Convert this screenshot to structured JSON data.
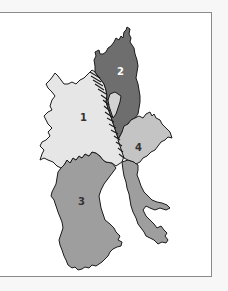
{
  "map": {
    "type": "regional division map",
    "colors": {
      "background": "#f7f7f7",
      "frame_fill": "#ffffff",
      "frame_border": "#8a8a8a",
      "outline": "#1a1a1a",
      "region_1": "#e6e6e6",
      "region_2": "#6e6e6e",
      "region_3": "#9e9e9e",
      "region_4": "#c4c4c4",
      "inset_light": "#d2d2d2"
    },
    "regions": [
      {
        "id": "1",
        "label": "1",
        "fill": "light gray"
      },
      {
        "id": "2",
        "label": "2",
        "fill": "dark gray"
      },
      {
        "id": "3",
        "label": "3",
        "fill": "medium gray"
      },
      {
        "id": "4",
        "label": "4",
        "fill": "light-medium gray"
      }
    ]
  }
}
